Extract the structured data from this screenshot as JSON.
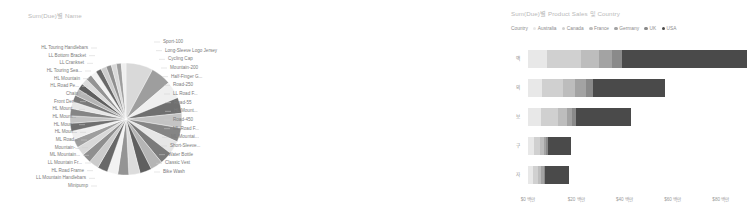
{
  "pie_panel": {
    "title": "Sum(Due)별 Name",
    "labels_right": [
      "Sport-100",
      "Long-Sleeve Logo Jersey",
      "Cycling Cap",
      "Mountain-200",
      "Half-Finger G...",
      "Road-250",
      "LL Road F...",
      "Road-55",
      "HL Mount...",
      "Road-450",
      "ML Road F...",
      "ML Mountai...",
      "Short-Sleeve...",
      "Water Bottle",
      "Classic Vest",
      "Bike Wash"
    ],
    "labels_left": [
      "HL Touring Handlebars",
      "LL Bottom Bracket",
      "LL Crankset",
      "HL Touring Sea...",
      "HL Mountain",
      "HL Road Pe...",
      "Chain",
      "Front Der...",
      "HL Mount...",
      "HL Mount...",
      "HL Moun...",
      "HL Moun...",
      "ML Road...",
      "Mountain-...",
      "ML Mountain...",
      "LL Mountain Fr...",
      "HL Road Frame",
      "LL Mountain Handlebars",
      "Minipump"
    ]
  },
  "bar_panel": {
    "title": "Sum(Due)별 Product Sales 및 Country",
    "legend_title": "Country"
  },
  "chart_data": [
    {
      "type": "pie",
      "title": "Sum(Due)별 Name",
      "legend": "none",
      "categories": [
        "Sport-100",
        "Long-Sleeve Logo Jersey",
        "Cycling Cap",
        "Mountain-200",
        "Half-Finger G...",
        "Road-250",
        "LL Road F...",
        "Road-55",
        "HL Mount...",
        "Road-450",
        "ML Road F...",
        "ML Mountai...",
        "Short-Sleeve...",
        "Water Bottle",
        "Classic Vest",
        "Bike Wash",
        "Minipump",
        "LL Mountain Handlebars",
        "HL Road Frame",
        "LL Mountain Fr...",
        "ML Mountain...",
        "Mountain-...",
        "ML Road...",
        "HL Moun...",
        "HL Moun...",
        "HL Mount...",
        "HL Mount...",
        "Front Der...",
        "Chain",
        "HL Road Pe...",
        "HL Mountain",
        "HL Touring Sea...",
        "LL Crankset",
        "LL Bottom Bracket",
        "HL Touring Handlebars"
      ],
      "values": [
        7.2,
        5.4,
        4.6,
        4.2,
        3.9,
        3.7,
        3.5,
        3.3,
        3.2,
        3.1,
        3.0,
        2.9,
        2.8,
        2.7,
        2.6,
        2.5,
        2.4,
        2.3,
        2.2,
        2.1,
        2.0,
        1.9,
        1.85,
        1.8,
        1.75,
        1.7,
        1.65,
        1.6,
        1.55,
        1.5,
        1.45,
        1.4,
        1.35,
        1.3,
        1.25
      ],
      "unit": "percent"
    },
    {
      "type": "bar",
      "orientation": "horizontal",
      "stacked": true,
      "title": "Sum(Due)별 Product Sales 및 Country",
      "xlabel": "",
      "ylabel": "",
      "categories": [
        "액",
        "의",
        "보",
        "구",
        "자"
      ],
      "series": [
        {
          "name": "Australia",
          "color": "#e8e8e8",
          "values": [
            8.0,
            6.0,
            5.5,
            2.6,
            2.2
          ]
        },
        {
          "name": "Canada",
          "color": "#d0d0d0",
          "values": [
            14.0,
            8.5,
            7.0,
            2.4,
            2.0
          ]
        },
        {
          "name": "France",
          "color": "#bdbdbd",
          "values": [
            7.5,
            5.0,
            3.8,
            1.5,
            1.4
          ]
        },
        {
          "name": "Germany",
          "color": "#a3a3a3",
          "values": [
            5.5,
            4.5,
            2.0,
            1.0,
            0.9
          ]
        },
        {
          "name": "UK",
          "color": "#8a8a8a",
          "values": [
            4.0,
            3.0,
            1.5,
            0.8,
            0.7
          ]
        },
        {
          "name": "USA",
          "color": "#4a4a4a",
          "values": [
            52.0,
            30.0,
            23.0,
            9.5,
            9.8
          ]
        }
      ],
      "xticks": [
        "$0 백만",
        "$20 백만",
        "$40 백만",
        "$60 백만",
        "$80 백만"
      ],
      "xtick_values": [
        0,
        20,
        40,
        60,
        80
      ],
      "xlim": [
        0,
        95
      ],
      "grid": false,
      "legend_position": "top"
    }
  ]
}
